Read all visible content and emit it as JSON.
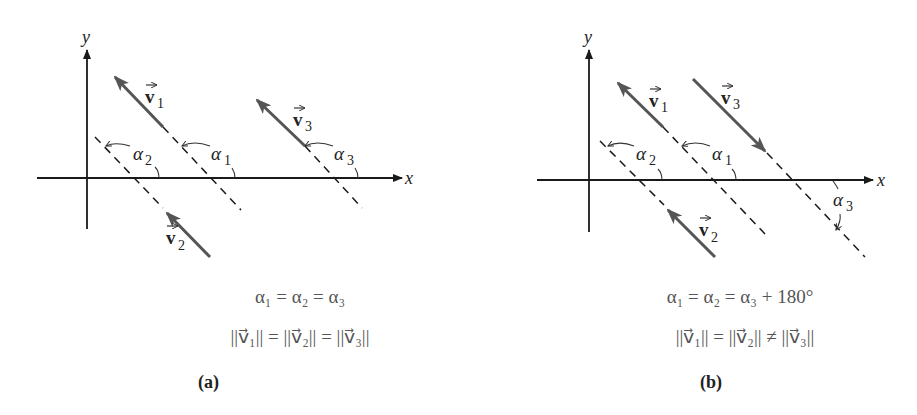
{
  "panels": [
    {
      "id": "a",
      "caption": "(a)",
      "axis_x_label": "x",
      "axis_y_label": "y",
      "vectors": [
        {
          "name": "v1",
          "label": "v",
          "sub": "1",
          "direction": "up-left"
        },
        {
          "name": "v2",
          "label": "v",
          "sub": "2",
          "direction": "up-left"
        },
        {
          "name": "v3",
          "label": "v",
          "sub": "3",
          "direction": "up-left"
        }
      ],
      "angles": [
        {
          "label": "α",
          "sub": "1"
        },
        {
          "label": "α",
          "sub": "2"
        },
        {
          "label": "α",
          "sub": "3"
        }
      ],
      "equation_1": "α₁ = α₂ = α₃",
      "equation_2": "||v⃗₁|| = ||v⃗₂|| = ||v⃗₃||"
    },
    {
      "id": "b",
      "caption": "(b)",
      "axis_x_label": "x",
      "axis_y_label": "y",
      "vectors": [
        {
          "name": "v1",
          "label": "v",
          "sub": "1",
          "direction": "up-left"
        },
        {
          "name": "v2",
          "label": "v",
          "sub": "2",
          "direction": "up-left"
        },
        {
          "name": "v3",
          "label": "v",
          "sub": "3",
          "direction": "down-right"
        }
      ],
      "angles": [
        {
          "label": "α",
          "sub": "1"
        },
        {
          "label": "α",
          "sub": "2"
        },
        {
          "label": "α",
          "sub": "3"
        }
      ],
      "equation_1": "α₁ = α₂ = α₃ + 180°",
      "equation_2": "||v⃗₁|| = ||v⃗₂|| ≠ ||v⃗₃||"
    }
  ]
}
